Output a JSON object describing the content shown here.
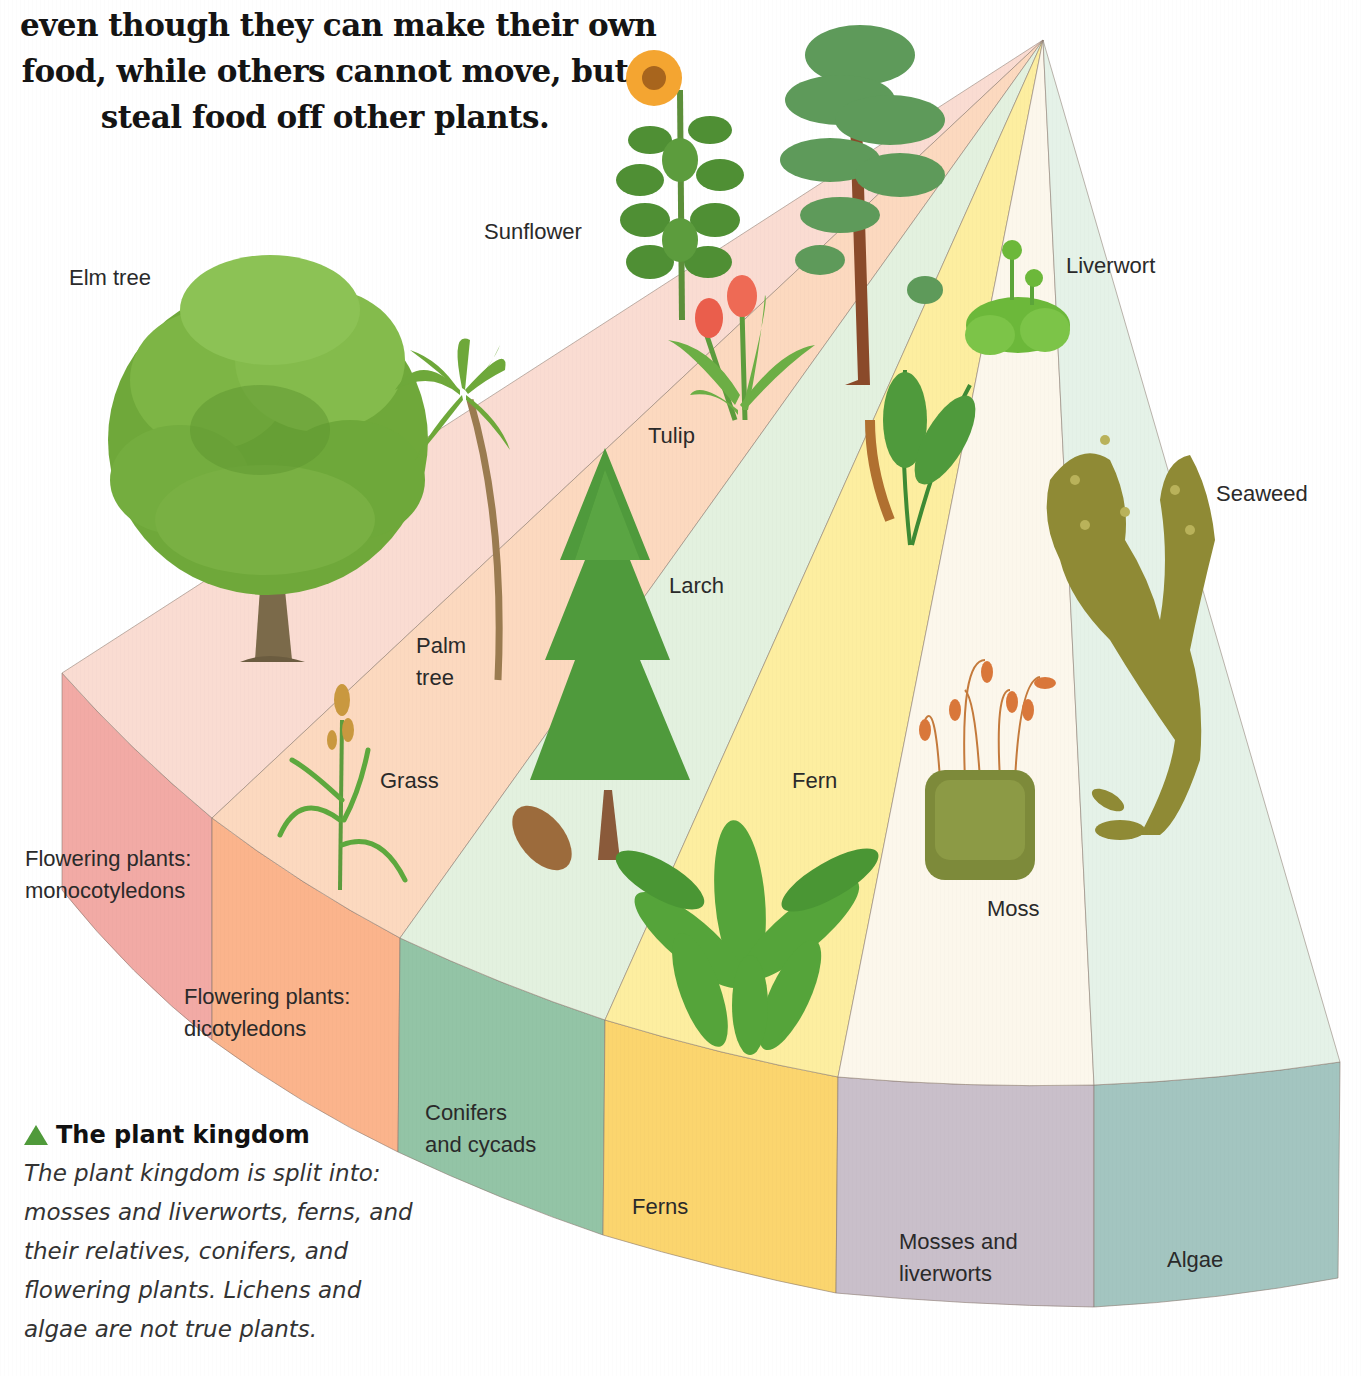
{
  "intro_text": {
    "lines": [
      "even though they can make their own",
      "food, while others cannot move, but",
      "steal food off other plants."
    ]
  },
  "diagram": {
    "title": "The plant kingdom",
    "groups": [
      {
        "id": "monocots",
        "label_line1": "Flowering plants:",
        "label_line2": "monocotyledons",
        "top_color": "#fadcd2",
        "side_color": "#f2aaa5"
      },
      {
        "id": "dicots",
        "label_line1": "Flowering plants:",
        "label_line2": "dicotyledons",
        "top_color": "#fcd9bf",
        "side_color": "#fbb48c"
      },
      {
        "id": "conifers",
        "label_line1": "Conifers",
        "label_line2": "and cycads",
        "top_color": "#e3f1df",
        "side_color": "#93c4a6"
      },
      {
        "id": "ferns",
        "label_line1": "Ferns",
        "label_line2": "",
        "top_color": "#fdeea0",
        "side_color": "#fbd56e"
      },
      {
        "id": "mosses",
        "label_line1": "Mosses and",
        "label_line2": "liverworts",
        "top_color": "#fcf7ec",
        "side_color": "#c9bfca"
      },
      {
        "id": "algae",
        "label_line1": "Algae",
        "label_line2": "",
        "top_color": "#e5f2e8",
        "side_color": "#a3c5c0"
      }
    ],
    "plants": {
      "elm_tree": "Elm tree",
      "sunflower": "Sunflower",
      "palm_tree_line1": "Palm",
      "palm_tree_line2": "tree",
      "tulip": "Tulip",
      "grass": "Grass",
      "larch": "Larch",
      "fern": "Fern",
      "moss": "Moss",
      "liverwort": "Liverwort",
      "seaweed": "Seaweed"
    }
  },
  "caption": {
    "title": "The plant kingdom",
    "icon": "green-triangle-icon",
    "icon_color": "#4f9a3a",
    "body_lines": [
      "The plant kingdom is split into:",
      "mosses and liverworts, ferns, and",
      "their relatives, conifers, and",
      "flowering plants. Lichens and",
      "algae are not true plants."
    ]
  }
}
